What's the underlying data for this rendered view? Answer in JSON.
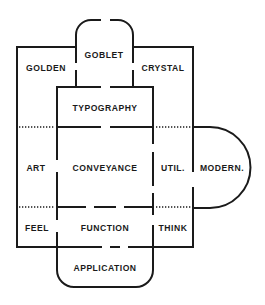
{
  "diagram": {
    "labels": {
      "goblet": "GOBLET",
      "golden": "GOLDEN",
      "crystal": "CRYSTAL",
      "typography": "TYPOGRAPHY",
      "art": "ART",
      "conveyance": "CONVEYANCE",
      "util": "UTIL.",
      "modern": "MODERN.",
      "feel": "FEEL",
      "function": "FUNCTION",
      "think": "THINK",
      "application": "APPLICATION"
    },
    "colors": {
      "line": "#1a1a1a",
      "background": "#ffffff"
    }
  }
}
